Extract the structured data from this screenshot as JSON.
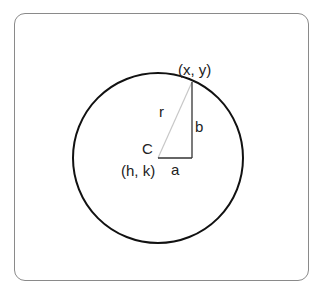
{
  "diagram": {
    "labels": {
      "point": "(x, y)",
      "radius": "r",
      "vertical_leg": "b",
      "center_letter": "C",
      "center_coords": "(h, k)",
      "horizontal_leg": "a"
    },
    "colors": {
      "circle": "#111111",
      "radius_line": "#c8c8c8",
      "legs": "#333333",
      "frame": "#8a8a8a"
    }
  }
}
